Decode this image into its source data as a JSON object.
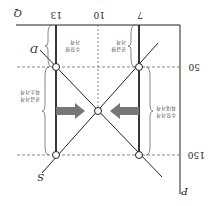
{
  "diagram": {
    "orientation": "rotated-180",
    "axes": {
      "y_label": "P",
      "x_label": "Q"
    },
    "price_ticks": [
      "150",
      "50"
    ],
    "quantity_ticks": [
      "7",
      "10",
      "13"
    ],
    "curves": {
      "supply": "S",
      "demand": "D"
    },
    "braces": {
      "left_upper": [
        "수요가격",
        "최대가격"
      ],
      "right_lower": [
        "공급가격",
        "최소가격"
      ],
      "bottom_left": [
        "공급량",
        "가격"
      ],
      "bottom_right": [
        "수요량",
        "가격"
      ]
    },
    "colors": {
      "lines": "#222222",
      "arrows": "#777777",
      "dashed": "#555555"
    }
  }
}
